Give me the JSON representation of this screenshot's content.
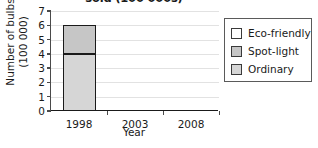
{
  "chart_data": {
    "type": "bar",
    "subtype": "stacked-bar",
    "title": "sold (100 000s)",
    "title_clipped": true,
    "xlabel": "Year",
    "ylabel": "Number of bulbs (100 000)",
    "ylabel_line1": "Number of bulbs",
    "ylabel_line2": "(100 000)",
    "categories": [
      "1998",
      "2003",
      "2008"
    ],
    "ylim": [
      0,
      7
    ],
    "yticks": [
      0,
      1,
      2,
      3,
      4,
      5,
      6,
      7
    ],
    "ytick_labels": [
      "0",
      "1",
      "2",
      "3",
      "4",
      "5",
      "6",
      "7"
    ],
    "grid": true,
    "grid_axis": "y",
    "legend_position": "right",
    "series": [
      {
        "name": "Eco-friendly",
        "color": "#ffffff",
        "values": [
          0,
          0,
          0
        ]
      },
      {
        "name": "Spot-light",
        "color": "#c6c6c6",
        "values": [
          2,
          0,
          0
        ]
      },
      {
        "name": "Ordinary",
        "color": "#d6d6d6",
        "values": [
          4,
          0,
          0
        ]
      }
    ],
    "stack_order_bottom_to_top": [
      "Ordinary",
      "Spot-light",
      "Eco-friendly"
    ],
    "bars": [
      {
        "category": "1998",
        "total": 6,
        "segments": [
          {
            "series": "Ordinary",
            "start": 0,
            "end": 4,
            "value": 4,
            "color": "#d6d6d6"
          },
          {
            "series": "Spot-light",
            "start": 4,
            "end": 6,
            "value": 2,
            "color": "#c6c6c6"
          }
        ]
      },
      {
        "category": "2003",
        "total": 0,
        "segments": []
      },
      {
        "category": "2008",
        "total": 0,
        "segments": []
      }
    ],
    "colors": {
      "axis": "#1a1a1a",
      "gridline": "#e2e2e2",
      "bar_outline": "#1a1a1a",
      "legend_border": "#5a5a5a",
      "background": "#ffffff"
    }
  },
  "legend": {
    "items": [
      {
        "label": "Eco-friendly",
        "color": "#ffffff"
      },
      {
        "label": "Spot-light",
        "color": "#c6c6c6"
      },
      {
        "label": "Ordinary",
        "color": "#d6d6d6"
      }
    ]
  }
}
